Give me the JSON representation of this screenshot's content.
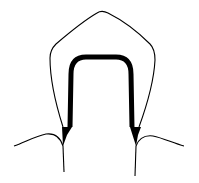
{
  "diagram": {
    "colors": {
      "background": "#ffffff",
      "stroke": "#000000"
    },
    "parts": [
      {
        "id": "crown-outline",
        "description": "thin outer crown contour"
      },
      {
        "id": "preparation",
        "description": "thick tooth preparation outline with chamfer margins"
      },
      {
        "id": "gingiva-left",
        "description": "left gum line"
      },
      {
        "id": "gingiva-right",
        "description": "right gum line"
      },
      {
        "id": "root-left",
        "description": "left root surface line"
      },
      {
        "id": "root-right",
        "description": "right root surface line"
      }
    ]
  }
}
